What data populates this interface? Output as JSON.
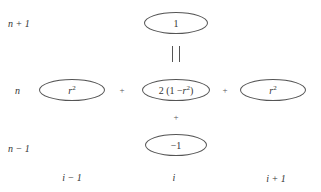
{
  "diagram": {
    "type": "finite-difference stencil",
    "row_labels": [
      {
        "id": "n+1",
        "text": "n + 1"
      },
      {
        "id": "n",
        "text": "n"
      },
      {
        "id": "n-1",
        "text": "n − 1"
      }
    ],
    "column_labels": [
      {
        "id": "i-1",
        "text": "i − 1"
      },
      {
        "id": "i",
        "text": "i"
      },
      {
        "id": "i+1",
        "text": "i + 1"
      }
    ],
    "nodes": {
      "top": {
        "row": "n+1",
        "col": "i",
        "text": "1"
      },
      "left": {
        "row": "n",
        "col": "i-1",
        "base": "r",
        "exp": "2"
      },
      "center": {
        "row": "n",
        "col": "i",
        "prefix": "2 (1 − ",
        "base": "r",
        "exp": "2",
        "suffix": ")"
      },
      "right": {
        "row": "n",
        "col": "i+1",
        "base": "r",
        "exp": "2"
      },
      "bottom": {
        "row": "n-1",
        "col": "i",
        "text": "−1"
      }
    },
    "operators": {
      "equals_vertical": "| |",
      "plus_left": "+",
      "plus_right": "+",
      "plus_below": "+"
    },
    "colors": {
      "stroke": "#555555",
      "text": "#333333",
      "background": "#ffffff"
    }
  }
}
